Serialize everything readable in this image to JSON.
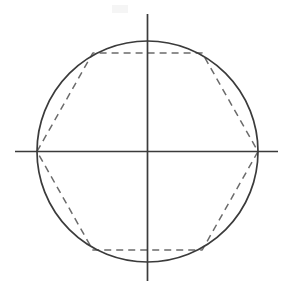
{
  "figure": {
    "background_color": "#ffffff",
    "width": 294,
    "height": 294,
    "center": {
      "x": 147.5,
      "y": 151.5
    },
    "circle": {
      "name": "circumscribed-circle",
      "cx": 147.5,
      "cy": 151.5,
      "r": 110.5,
      "stroke_color": "#3b3b3b",
      "stroke_width": 1.7,
      "fill": "none",
      "style": "solid"
    },
    "hexagon": {
      "name": "inscribed-hexagon",
      "sides": 6,
      "stroke_color": "#6b6b6b",
      "stroke_width": 1.5,
      "fill": "none",
      "style": "dashed",
      "dash_pattern": "7 5",
      "vertices": [
        {
          "label": "left",
          "x": 37.0,
          "y": 151.5
        },
        {
          "label": "top-left",
          "x": 92.8,
          "y": 53.0
        },
        {
          "label": "top-right",
          "x": 202.2,
          "y": 53.0
        },
        {
          "label": "right",
          "x": 258.0,
          "y": 151.5
        },
        {
          "label": "bottom-right",
          "x": 202.2,
          "y": 250.0
        },
        {
          "label": "bottom-left",
          "x": 92.8,
          "y": 250.0
        }
      ]
    },
    "axes": {
      "horizontal": {
        "name": "horizontal-axis",
        "x1": 15.0,
        "y1": 151.5,
        "x2": 278.0,
        "y2": 151.5,
        "stroke_color": "#3b3b3b",
        "stroke_width": 1.7,
        "style": "solid"
      },
      "vertical": {
        "name": "vertical-axis",
        "x1": 147.5,
        "y1": 14.0,
        "x2": 147.5,
        "y2": 281.0,
        "stroke_color": "#3b3b3b",
        "stroke_width": 1.7,
        "style": "solid"
      }
    },
    "smudge": {
      "name": "scan-artifact",
      "x": 112,
      "y": 5,
      "width": 16,
      "height": 8,
      "color": "#ededed"
    }
  }
}
